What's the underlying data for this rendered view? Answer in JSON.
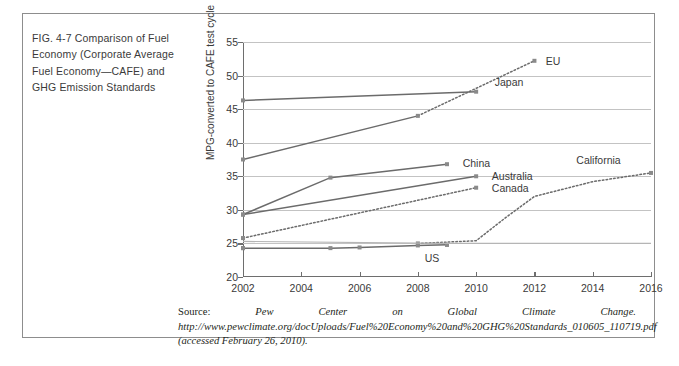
{
  "figure": {
    "caption": "FIG. 4-7   Comparison of Fuel Economy (Corporate Average Fuel Economy—CAFE) and GHG Emission Standards",
    "source_prefix": "Source: ",
    "source_italic": "Pew Center on Global Climate Change.  http://www.pewclimate.org/docUploads/Fuel%20Economy%20and%20GHG%20Standards_010605_110719.pdf (accessed February 26, 2010).",
    "border_color": "#8d8d8d"
  },
  "chart_data": {
    "type": "line",
    "title": "",
    "xlabel": "",
    "ylabel": "MPG-converted to CAFE test cycle",
    "xlim": [
      2002,
      2016
    ],
    "ylim": [
      20,
      55
    ],
    "xticks": [
      2002,
      2004,
      2006,
      2008,
      2010,
      2012,
      2014,
      2016
    ],
    "yticks": [
      20,
      25,
      30,
      35,
      40,
      45,
      50,
      55
    ],
    "grid": "horizontal",
    "legend": "inline-labels",
    "line_color": "#6b6b6b",
    "series": [
      {
        "name": "EU",
        "style": "solid-then-dotted",
        "label_x": 2012.25,
        "label_y": 52.2,
        "x": [
          2002,
          2008,
          2012
        ],
        "values": [
          37.5,
          44.0,
          52.2
        ]
      },
      {
        "name": "Japan",
        "style": "solid",
        "label_x": 2010.5,
        "label_y": 49.1,
        "x": [
          2002,
          2010
        ],
        "values": [
          46.3,
          47.6
        ]
      },
      {
        "name": "China",
        "style": "solid",
        "label_x": 2009.4,
        "label_y": 37.0,
        "x": [
          2002,
          2005,
          2009
        ],
        "values": [
          29.3,
          34.8,
          36.8
        ]
      },
      {
        "name": "Australia",
        "style": "solid",
        "label_x": 2010.4,
        "label_y": 35.0,
        "x": [
          2002,
          2010
        ],
        "values": [
          29.3,
          35.0
        ]
      },
      {
        "name": "Canada",
        "style": "dotted",
        "label_x": 2010.4,
        "label_y": 33.3,
        "x": [
          2002,
          2010
        ],
        "values": [
          25.8,
          33.3
        ]
      },
      {
        "name": "California",
        "style": "dotted",
        "label_x": 2013.3,
        "label_y": 37.4,
        "x": [
          2008,
          2010,
          2011,
          2012,
          2014,
          2016
        ],
        "values": [
          25.0,
          25.4,
          28.8,
          32.0,
          34.2,
          35.5
        ]
      },
      {
        "name": "US",
        "style": "solid",
        "label_x": 2008.1,
        "label_y": 22.9,
        "x": [
          2002,
          2005,
          2006,
          2008,
          2009
        ],
        "values": [
          24.3,
          24.3,
          24.4,
          24.7,
          24.8
        ]
      },
      {
        "name": "US-upper",
        "style": "solid-light",
        "label_x": null,
        "label_y": null,
        "x": [
          2002,
          2009,
          2016
        ],
        "values": [
          25.3,
          25.0,
          25.0
        ]
      }
    ]
  }
}
